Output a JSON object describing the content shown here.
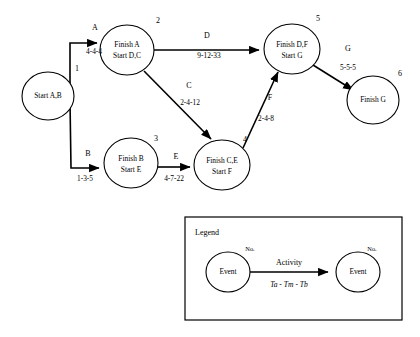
{
  "diagram": {
    "nodes": [
      {
        "id": "n1",
        "number": "1",
        "line1": "Start A,B",
        "line2": "",
        "cx": 48,
        "cy": 96,
        "rx": 26,
        "ry": 24,
        "num_x": 77,
        "num_y": 71
      },
      {
        "id": "n2",
        "number": "2",
        "line1": "Finish A",
        "line2": "Start D,C",
        "cx": 127,
        "cy": 50,
        "rx": 27,
        "ry": 25,
        "num_x": 158,
        "num_y": 23
      },
      {
        "id": "n3",
        "number": "3",
        "line1": "Finish B",
        "line2": "Start E",
        "cx": 131,
        "cy": 163,
        "rx": 27,
        "ry": 25,
        "num_x": 156,
        "num_y": 141
      },
      {
        "id": "n4",
        "number": "4",
        "line1": "Finish C,E",
        "line2": "Start F",
        "cx": 222,
        "cy": 165,
        "rx": 28,
        "ry": 25,
        "num_x": 245,
        "num_y": 142
      },
      {
        "id": "n5",
        "number": "5",
        "line1": "Finish D,F",
        "line2": "Start G",
        "cx": 292,
        "cy": 49,
        "rx": 28,
        "ry": 25,
        "num_x": 318,
        "num_y": 21
      },
      {
        "id": "n6",
        "number": "6",
        "line1": "Finish G",
        "line2": "",
        "cx": 373,
        "cy": 100,
        "rx": 26,
        "ry": 24,
        "num_x": 400,
        "num_y": 76
      }
    ],
    "activities": [
      {
        "id": "A",
        "name": "A",
        "times": "4-4-4",
        "from": "1",
        "to": "2",
        "name_x": 95,
        "name_y": 30,
        "time_x": 94,
        "time_y": 51
      },
      {
        "id": "B",
        "name": "B",
        "times": "1-3-5",
        "from": "1",
        "to": "3",
        "name_x": 88,
        "name_y": 156,
        "time_x": 85,
        "time_y": 179
      },
      {
        "id": "C",
        "name": "C",
        "times": "2-4-12",
        "from": "2",
        "to": "4",
        "name_x": 189,
        "name_y": 88,
        "time_x": 190,
        "time_y": 103
      },
      {
        "id": "D",
        "name": "D",
        "times": "9-12-33",
        "from": "2",
        "to": "5",
        "name_x": 207,
        "name_y": 38,
        "time_x": 209,
        "time_y": 56
      },
      {
        "id": "E",
        "name": "E",
        "times": "4-7-22",
        "from": "3",
        "to": "4",
        "name_x": 176,
        "name_y": 159,
        "time_x": 174,
        "time_y": 179
      },
      {
        "id": "F",
        "name": "F",
        "times": "2-4-8",
        "from": "4",
        "to": "5",
        "name_x": 270,
        "name_y": 100,
        "time_x": 266,
        "time_y": 119
      },
      {
        "id": "G",
        "name": "G",
        "times": "5-5-5",
        "from": "5",
        "to": "6",
        "name_x": 348,
        "name_y": 51,
        "time_x": 348,
        "time_y": 69
      }
    ]
  },
  "legend": {
    "title": "Legend",
    "event_left_label": "Event",
    "event_right_label": "Event",
    "number_left_label": "No.",
    "number_right_label": "No.",
    "activity_label": "Activity",
    "time_label": "Ta - Tm - Tb"
  },
  "colors": {
    "stroke": "#000000",
    "background": "#ffffff",
    "text": "#000000"
  }
}
